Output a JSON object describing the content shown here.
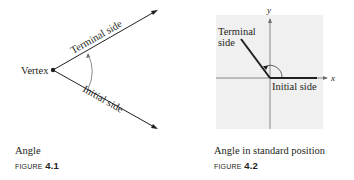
{
  "figures": [
    {
      "id": "4.1",
      "labels": {
        "vertex": "Vertex",
        "terminal": "Terminal side",
        "initial": "Initial side"
      },
      "caption": "Angle",
      "figure_word": "FIGURE",
      "figure_number": "4.1"
    },
    {
      "id": "4.2",
      "labels": {
        "terminal_line1": "Terminal",
        "terminal_line2": "side",
        "initial": "Initial side",
        "x_axis": "x",
        "y_axis": "y"
      },
      "caption": "Angle in standard position",
      "figure_word": "FIGURE",
      "figure_number": "4.2"
    }
  ],
  "colors": {
    "ink": "#231f20",
    "panel": "#f0f0f0",
    "axis": "#6d6e71"
  }
}
